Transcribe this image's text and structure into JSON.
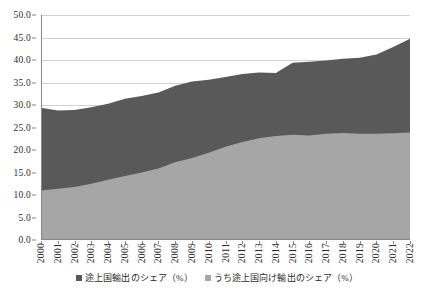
{
  "chart_data": {
    "type": "area",
    "stacked": false,
    "title": "",
    "subtitle": "",
    "xlabel": "",
    "ylabel": "",
    "ylim": [
      0.0,
      50.0
    ],
    "y_ticks": [
      0.0,
      5.0,
      10.0,
      15.0,
      20.0,
      25.0,
      30.0,
      35.0,
      40.0,
      45.0,
      50.0
    ],
    "y_tick_labels": [
      "0.0",
      "5.0",
      "10.0",
      "15.0",
      "20.0",
      "25.0",
      "30.0",
      "35.0",
      "40.0",
      "45.0",
      "50.0"
    ],
    "grid": true,
    "grid_axis": "y",
    "legend_position": "bottom",
    "categories": [
      "2000",
      "2001",
      "2002",
      "2003",
      "2004",
      "2005",
      "2006",
      "2007",
      "2008",
      "2009",
      "2010",
      "2011",
      "2012",
      "2013",
      "2014",
      "2015",
      "2016",
      "2017",
      "2018",
      "2019",
      "2020",
      "2021",
      "2022"
    ],
    "series": [
      {
        "name": "途上国輸出のシェア（%）",
        "color": "#595959",
        "values": [
          29.4,
          28.8,
          28.9,
          29.5,
          30.3,
          31.4,
          32.0,
          32.8,
          34.3,
          35.2,
          35.6,
          36.2,
          36.9,
          37.2,
          37.1,
          39.4,
          39.6,
          39.9,
          40.3,
          40.5,
          41.2,
          42.9,
          44.7
        ]
      },
      {
        "name": "うち途上国向け輸出のシェア（%）",
        "color": "#a6a6a6",
        "values": [
          11.0,
          11.4,
          11.8,
          12.5,
          13.4,
          14.2,
          15.0,
          15.9,
          17.3,
          18.2,
          19.4,
          20.7,
          21.8,
          22.6,
          23.1,
          23.4,
          23.2,
          23.6,
          23.8,
          23.6,
          23.6,
          23.7,
          23.9
        ]
      }
    ]
  },
  "legend": {
    "entries": [
      {
        "label": "途上国輸出のシェア（%）",
        "color": "#595959"
      },
      {
        "label": "うち途上国向け輸出のシェア（%）",
        "color": "#a6a6a6"
      }
    ]
  },
  "colors": {
    "series_upper": "#595959",
    "series_lower": "#a6a6a6",
    "gridline": "#d0d0d0",
    "axis": "#868686",
    "text": "#2b2b2b",
    "background": "#ffffff"
  }
}
